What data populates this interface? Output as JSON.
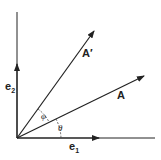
{
  "diagram": {
    "labels": {
      "e1": "e",
      "e1_sub": "1",
      "e2": "e",
      "e2_sub": "2",
      "A": "A",
      "A_prime": "A′",
      "phi": "φ",
      "theta": "θ"
    },
    "colors": {
      "stroke": "#222222",
      "background": "#ffffff"
    }
  }
}
